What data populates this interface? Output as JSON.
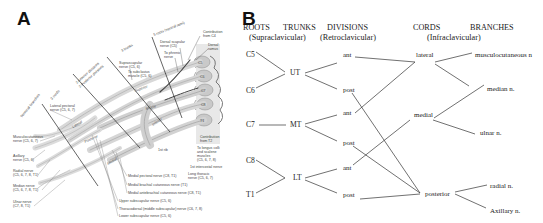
{
  "panel_a": {
    "label": "A",
    "regions": [
      {
        "name": "5 roots",
        "sub": "(ventral rami)"
      },
      {
        "name": "3 trunks"
      },
      {
        "name": "2 divisions",
        "sub": "(Anterior divisions / Posterior divisions)"
      },
      {
        "name": "3 cords"
      },
      {
        "name": "Terminal branches"
      }
    ],
    "region_labels": {
      "roots": "5 roots (ventral rami)",
      "trunks": "3 trunks",
      "divisions": "2 Anterior divisions\n2 Posterior divisions",
      "divisions_line1": "2 Anterior divisions",
      "divisions_line2": "2 Posterior divisions",
      "cords": "3 cords",
      "terminal": "Terminal branches"
    },
    "structures": {
      "superior": "Superior",
      "middle": "Middle",
      "inferior": "Inferior",
      "lateral": "Lateral",
      "posterior": "Posterior",
      "medial": "Medial",
      "rib": "1st rib"
    },
    "vertebra_labels": [
      "C5",
      "C6",
      "C7",
      "C8",
      "T1"
    ],
    "annotations_top": [
      {
        "text": "Contribution",
        "text2": "from C4"
      },
      {
        "text": "Dorsal",
        "text2": "ramus"
      },
      {
        "text": "Dorsal scapular",
        "text2": "nerve (C5)"
      },
      {
        "text": "To phrenic",
        "text2": "nerve"
      },
      {
        "text": "Suprascapular",
        "text2": "nerve (C5, 6)"
      },
      {
        "text": "To subclavius",
        "text2": "muscle (C5, 6)"
      }
    ],
    "annotations_left": [
      {
        "text": "Lateral pectoral",
        "text2": "nerve (C5, 6, 7)"
      },
      {
        "text": "Musculocutaneous",
        "text2": "nerve (C5, 6, 7)"
      },
      {
        "text": "Axillary",
        "text2": "nerve (C5, 6)"
      },
      {
        "text": "Radial nerve",
        "text2": "(C5, 6, 7, 8, T1)"
      },
      {
        "text": "Median nerve",
        "text2": "(C5, 6, 7, 8, T1)"
      },
      {
        "text": "Ulnar nerve",
        "text2": "(C7, 8, T1)"
      }
    ],
    "annotations_right": [
      {
        "text": "Contribution",
        "text2": "from T2"
      },
      {
        "text": "To longus colli",
        "text2": "and scalene",
        "text3": "muscles",
        "text4": "(C5, 6, 7, 8)"
      },
      {
        "text": "1st intercostal nerve"
      },
      {
        "text": "Long thoracic",
        "text2": "nerve (C5, 6, 7)"
      }
    ],
    "annotations_bottom": [
      "Medial pectoral nerve (C8, T1)",
      "Medial brachial cutaneous nerve (T1)",
      "Medial antebrachial cutaneous nerve (C8, T1)",
      "Upper subscapular nerve (C5, 6)",
      "Thoracodorsal (middle subscapular) nerve (C6, 7, 8)",
      "Lower subscapular nerve (C5, 6)"
    ]
  },
  "panel_b": {
    "label": "B",
    "headers": {
      "roots": "ROOTS",
      "trunks": "TRUNKS",
      "supraclavicular": "(Supraclavicular)",
      "divisions": "DIVISIONS",
      "retroclavicular": "(Retroclavicular)",
      "cords": "CORDS",
      "infraclavicular": "(Infraclavicular)",
      "branches": "BRANCHES"
    },
    "roots": [
      "C5",
      "C6",
      "C7",
      "C8",
      "T1"
    ],
    "trunks": [
      "UT",
      "MT",
      "LT"
    ],
    "divisions": [
      "ant",
      "post",
      "ant",
      "post",
      "ant",
      "post"
    ],
    "cords": [
      "lateral",
      "medial",
      "posterior"
    ],
    "branches": [
      "musculocutaneous n",
      "median n.",
      "ulnar n.",
      "radial n.",
      "Axillary n."
    ]
  }
}
